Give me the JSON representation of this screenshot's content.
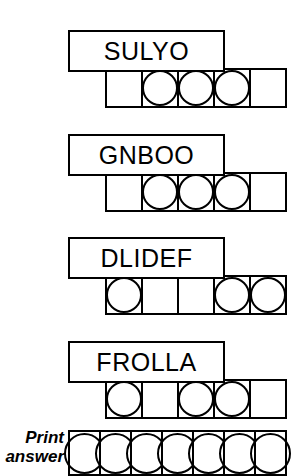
{
  "puzzle": {
    "rows": [
      {
        "word": "SULYO",
        "top": 30,
        "cells": [
          {
            "circled": false
          },
          {
            "circled": true
          },
          {
            "circled": true
          },
          {
            "circled": true
          },
          {
            "circled": false
          }
        ]
      },
      {
        "word": "GNBOO",
        "top": 134,
        "cells": [
          {
            "circled": false
          },
          {
            "circled": true
          },
          {
            "circled": true
          },
          {
            "circled": true
          },
          {
            "circled": false
          }
        ]
      },
      {
        "word": "DLIDEF",
        "top": 237,
        "cells": [
          {
            "circled": true
          },
          {
            "circled": false
          },
          {
            "circled": false
          },
          {
            "circled": true
          },
          {
            "circled": true
          }
        ]
      },
      {
        "word": "FROLLA",
        "top": 341,
        "cells": [
          {
            "circled": true
          },
          {
            "circled": false
          },
          {
            "circled": true
          },
          {
            "circled": true
          },
          {
            "circled": false
          }
        ]
      }
    ],
    "answer": {
      "top": 430,
      "label_line1": "Print",
      "label_line2": "answer",
      "label_top": 428,
      "cells": [
        {
          "circled": true
        },
        {
          "circled": true
        },
        {
          "circled": true
        },
        {
          "circled": true
        },
        {
          "circled": true
        },
        {
          "circled": true
        },
        {
          "circled": true
        }
      ]
    }
  }
}
